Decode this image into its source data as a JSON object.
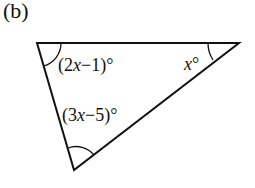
{
  "part_label": "(b)",
  "figure": {
    "shape": "triangle",
    "angles": [
      {
        "vertex": "top-left",
        "expr_prefix": "(2",
        "var": "x",
        "expr_suffix": "−1)°"
      },
      {
        "vertex": "top-right",
        "expr_prefix": "",
        "var": "x",
        "expr_suffix": "°"
      },
      {
        "vertex": "bottom",
        "expr_prefix": "(3",
        "var": "x",
        "expr_suffix": "−5)°"
      }
    ]
  }
}
